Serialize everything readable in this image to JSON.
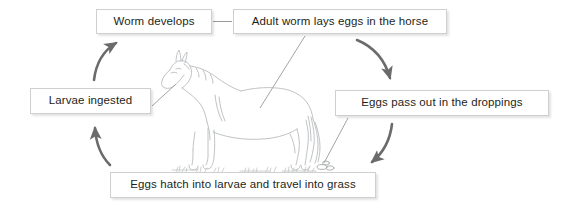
{
  "diagram": {
    "cycle_direction": "clockwise",
    "colors": {
      "background": "#ffffff",
      "box_fill": "#ffffff",
      "box_border": "#cfcfcf",
      "text": "#231f20",
      "arrow": "#6b6b6b",
      "leader_line": "#8f8f8f",
      "horse_line": "#b9bbbd"
    },
    "nodes": [
      {
        "id": "worm-develops",
        "label": "Worm develops"
      },
      {
        "id": "adult-worm",
        "label": "Adult worm lays eggs in the horse"
      },
      {
        "id": "eggs-droppings",
        "label": "Eggs pass out in the droppings"
      },
      {
        "id": "eggs-hatch",
        "label": "Eggs hatch into larvae and travel into grass"
      },
      {
        "id": "larvae-ingested",
        "label": "Larvae ingested"
      }
    ],
    "connectors": [
      {
        "from": "worm-develops",
        "to": "adult-worm",
        "kind": "straight-line",
        "direction": "none"
      },
      {
        "from": "adult-worm",
        "to": "eggs-droppings",
        "kind": "curved-arrow",
        "direction": "down"
      },
      {
        "from": "eggs-droppings",
        "to": "eggs-hatch",
        "kind": "curved-arrow",
        "direction": "down-left"
      },
      {
        "from": "eggs-hatch",
        "to": "larvae-ingested",
        "kind": "curved-arrow",
        "direction": "up"
      },
      {
        "from": "larvae-ingested",
        "to": "worm-develops",
        "kind": "curved-arrow",
        "direction": "up-right"
      }
    ],
    "leader_lines": [
      {
        "from": "larvae-ingested",
        "points_to": "horse-muzzle"
      },
      {
        "from": "adult-worm",
        "points_to": "horse-belly"
      },
      {
        "from": "eggs-droppings",
        "points_to": "droppings-on-ground"
      }
    ],
    "illustration": {
      "name": "horse-line-drawing",
      "description": "Line-art side view of a horse facing left standing on grass",
      "ground_features": [
        "grass-tufts",
        "droppings"
      ]
    }
  }
}
